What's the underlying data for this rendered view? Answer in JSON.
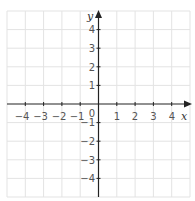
{
  "diagram": {
    "type": "coordinate-plane",
    "x_axis": {
      "label": "x",
      "min": -5,
      "max": 5,
      "tick_labels": [
        "-4",
        "-3",
        "-2",
        "-1",
        "1",
        "2",
        "3",
        "4"
      ]
    },
    "y_axis": {
      "label": "y",
      "min": -5,
      "max": 5,
      "tick_labels": [
        "4",
        "3",
        "2",
        "1",
        "-1",
        "-2",
        "-3",
        "-4"
      ]
    },
    "origin_label": "0",
    "grid": true,
    "colors": {
      "grid": "#e3e3e3",
      "axis": "#222222",
      "text": "#555555"
    }
  },
  "labels": {
    "x_name": "x",
    "y_name": "y",
    "origin": "0",
    "x_neg4": "−4",
    "x_neg3": "−3",
    "x_neg2": "−2",
    "x_neg1": "−1",
    "x_1": "1",
    "x_2": "2",
    "x_3": "3",
    "x_4": "4",
    "y_4": "4",
    "y_3": "3",
    "y_2": "2",
    "y_1": "1",
    "y_neg1": "−1",
    "y_neg2": "−2",
    "y_neg3": "−3",
    "y_neg4": "−4"
  }
}
